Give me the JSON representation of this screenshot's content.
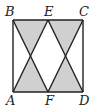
{
  "figure": {
    "type": "geometry",
    "shade_color": "#d0d0d0",
    "line_color": "#222222"
  },
  "labels": {
    "A": "A",
    "B": "B",
    "C": "C",
    "D": "D",
    "E": "E",
    "F": "F"
  },
  "segments": [
    {
      "from": "B",
      "to": "C"
    },
    {
      "from": "C",
      "to": "D"
    },
    {
      "from": "D",
      "to": "A"
    },
    {
      "from": "A",
      "to": "B"
    },
    {
      "from": "B",
      "to": "F"
    },
    {
      "from": "E",
      "to": "A"
    },
    {
      "from": "E",
      "to": "D"
    },
    {
      "from": "C",
      "to": "F"
    }
  ],
  "shaded_regions": [
    {
      "vertices": [
        "B",
        "E",
        "intersection(BF,EA)"
      ]
    },
    {
      "vertices": [
        "E",
        "C",
        "intersection(ED,CF)"
      ]
    },
    {
      "vertices": [
        "A",
        "F",
        "intersection(BF,EA)"
      ]
    },
    {
      "vertices": [
        "F",
        "D",
        "intersection(ED,CF)"
      ]
    }
  ]
}
